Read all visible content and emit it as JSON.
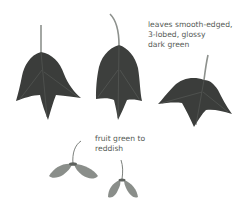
{
  "illustration": {
    "subject": "leaves and fruit illustration",
    "annotations": {
      "leaves": "leaves smooth-edged,\n3-lobed, glossy\ndark green",
      "fruit": "fruit green to\nreddish"
    },
    "colors": {
      "leaf_dark": "#3b3d3b",
      "leaf_mid": "#4a4c4a",
      "vein": "#6f736f",
      "stalk": "#8d918d",
      "fruit": "#8a8e8a",
      "text": "#555a55"
    }
  }
}
